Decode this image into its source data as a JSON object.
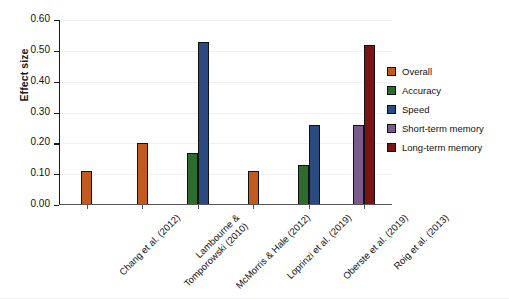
{
  "chart_data": {
    "type": "bar",
    "title": "",
    "xlabel": "",
    "ylabel": "Effect size",
    "ylim": [
      0.0,
      0.6
    ],
    "ytick_labels": [
      "0.00",
      "0.10",
      "0.20",
      "0.30",
      "0.40",
      "0.50",
      "0.60"
    ],
    "ytick_values": [
      0.0,
      0.1,
      0.2,
      0.3,
      0.4,
      0.5,
      0.6
    ],
    "grid": true,
    "legend_position": "right",
    "categories": [
      "Chang et al. (2012)",
      "Lambourne &\nTomporowski (2010)",
      "McMorris & Hale (2012)",
      "Loprinzi et al. (2019)",
      "Oberste et al. (2019)",
      "Roig et al. (2013)"
    ],
    "series": [
      {
        "name": "Overall",
        "color": "#C25A1E",
        "values": [
          0.11,
          0.2,
          null,
          0.11,
          null,
          null
        ]
      },
      {
        "name": "Accuracy",
        "color": "#2E6B2E",
        "values": [
          null,
          null,
          0.17,
          null,
          0.13,
          null
        ]
      },
      {
        "name": "Speed",
        "color": "#2B4A80",
        "values": [
          null,
          null,
          0.53,
          null,
          0.26,
          null
        ]
      },
      {
        "name": "Short-term memory",
        "color": "#7B5B8C",
        "values": [
          null,
          null,
          null,
          null,
          null,
          0.26
        ]
      },
      {
        "name": "Long-term memory",
        "color": "#7A1515",
        "values": [
          null,
          null,
          null,
          null,
          null,
          0.52
        ]
      }
    ],
    "legend_entries": [
      "Overall",
      "Accuracy",
      "Speed",
      "Short-term memory",
      "Long-term memory"
    ]
  }
}
